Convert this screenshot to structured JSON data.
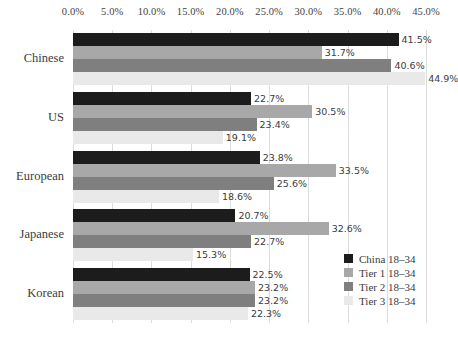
{
  "chart_data": {
    "type": "bar",
    "orientation": "horizontal",
    "title": "",
    "xlabel": "",
    "ylabel": "",
    "xlim": [
      0,
      45
    ],
    "xtick_labels": [
      "0.0%",
      "5.0%",
      "10.0%",
      "15.0%",
      "20.0%",
      "25.0%",
      "30.0%",
      "35.0%",
      "40.0%",
      "45.0%"
    ],
    "xtick_values": [
      0,
      5,
      10,
      15,
      20,
      25,
      30,
      35,
      40,
      45
    ],
    "grid": true,
    "legend_position": "bottom-right",
    "categories": [
      "Chinese",
      "US",
      "European",
      "Japanese",
      "Korean"
    ],
    "series": [
      {
        "name": "China 18–34",
        "color": "#1c1c1c",
        "values": [
          41.5,
          22.7,
          23.8,
          20.7,
          22.5
        ],
        "labels": [
          "41.5%",
          "22.7%",
          "23.8%",
          "20.7%",
          "22.5%"
        ]
      },
      {
        "name": "Tier 1 18–34",
        "color": "#a8a8a8",
        "values": [
          31.7,
          30.5,
          33.5,
          32.6,
          23.2
        ],
        "labels": [
          "31.7%",
          "30.5%",
          "33.5%",
          "32.6%",
          "23.2%"
        ]
      },
      {
        "name": "Tier 2 18–34",
        "color": "#7f7f7f",
        "values": [
          40.6,
          23.4,
          25.6,
          22.7,
          23.2
        ],
        "labels": [
          "40.6%",
          "23.4%",
          "25.6%",
          "22.7%",
          "23.2%"
        ]
      },
      {
        "name": "Tier 3 18–34",
        "color": "#e9e9e9",
        "values": [
          44.9,
          19.1,
          18.6,
          15.3,
          22.3
        ],
        "labels": [
          "44.9%",
          "19.1%",
          "18.6%",
          "15.3%",
          "22.3%"
        ]
      }
    ]
  },
  "legend": {
    "items": [
      {
        "label": "China 18–34",
        "color": "#1c1c1c"
      },
      {
        "label": "Tier 1 18–34",
        "color": "#a8a8a8"
      },
      {
        "label": "Tier 2 18–34",
        "color": "#7f7f7f"
      },
      {
        "label": "Tier 3 18–34",
        "color": "#e9e9e9"
      }
    ]
  },
  "colors": {
    "gridline": "#dcdcdc",
    "axis": "#c9c9c9",
    "text": "#3b3b3b",
    "background": "#ffffff"
  }
}
